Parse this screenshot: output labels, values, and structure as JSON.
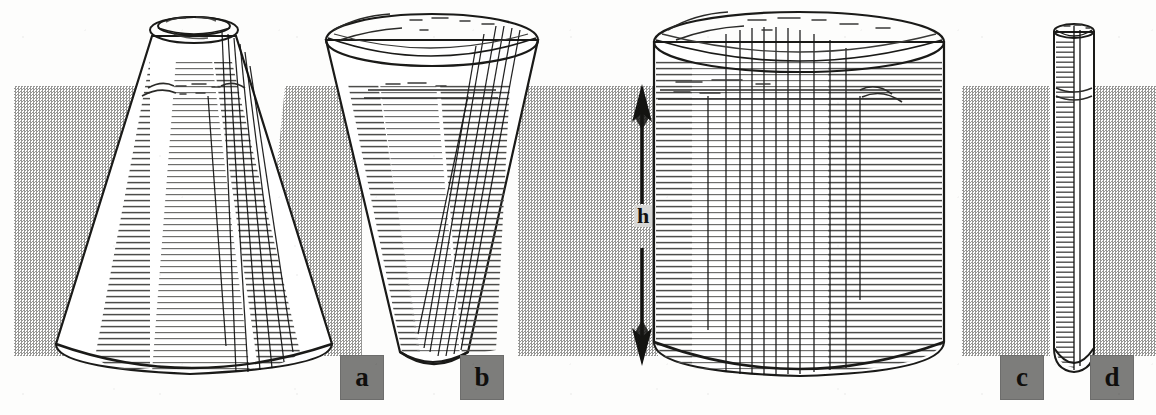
{
  "figure": {
    "background_color": "#fdfdfc",
    "liquid_color": "#8e8e8c",
    "ink_color": "#1a1a18",
    "chip_color": "#7d7d7b"
  },
  "dimension": {
    "label": "h",
    "name": "liquid-height",
    "arrow_style": "double-headed-vertical",
    "top_y": 88,
    "bottom_y": 356
  },
  "liquid_level": {
    "surface_y": 86,
    "base_y": 356
  },
  "vessels": [
    {
      "id": "a",
      "label": "a",
      "shape": "narrow-necked cone",
      "description": "wide round bottom tapering up to a narrow neck opening",
      "top_width": 62,
      "bottom_width": 320,
      "x": 20,
      "top_y": 14,
      "bottom_y": 372
    },
    {
      "id": "b",
      "label": "b",
      "shape": "inverted cone (funnel)",
      "description": "wide flaring mouth narrowing down to a small base",
      "top_width": 232,
      "bottom_width": 96,
      "x": 328,
      "top_y": 16,
      "bottom_y": 368
    },
    {
      "id": "c",
      "label": "c",
      "shape": "wide cylinder",
      "description": "straight-sided wide cylindrical jar",
      "top_width": 318,
      "bottom_width": 318,
      "x": 650,
      "top_y": 14,
      "bottom_y": 372
    },
    {
      "id": "d",
      "label": "d",
      "shape": "narrow tube",
      "description": "slender straight tube with a small flared rim",
      "top_width": 34,
      "bottom_width": 34,
      "x": 1052,
      "top_y": 24,
      "bottom_y": 368
    }
  ],
  "labels": [
    {
      "text": "a",
      "name": "vessel-label-a",
      "x": 340,
      "y": 355
    },
    {
      "text": "b",
      "name": "vessel-label-b",
      "x": 460,
      "y": 355
    },
    {
      "text": "c",
      "name": "vessel-label-c",
      "x": 1000,
      "y": 355
    },
    {
      "text": "d",
      "name": "vessel-label-d",
      "x": 1090,
      "y": 355
    }
  ]
}
